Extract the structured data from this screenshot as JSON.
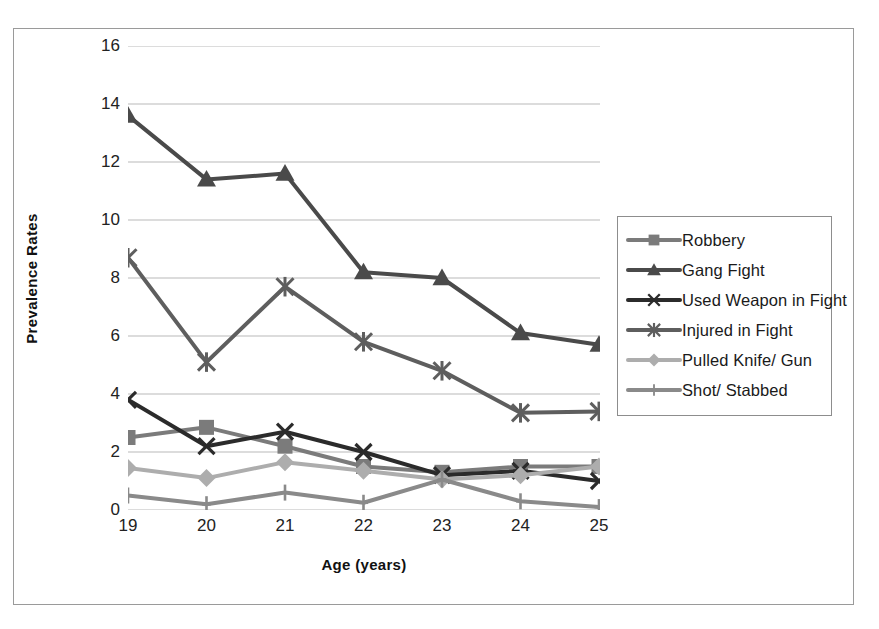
{
  "chart_data": {
    "type": "line",
    "title": "",
    "xlabel": "Age (years)",
    "ylabel": "Prevalence Rates",
    "categories": [
      "19",
      "20",
      "21",
      "22",
      "23",
      "24",
      "25"
    ],
    "x": [
      19,
      20,
      21,
      22,
      23,
      24,
      25
    ],
    "xlim": [
      19,
      25
    ],
    "ylim": [
      0,
      16
    ],
    "yticks": [
      0,
      2,
      4,
      6,
      8,
      10,
      12,
      14,
      16
    ],
    "grid": "horizontal",
    "legend_position": "right",
    "series": [
      {
        "name": "Robbery",
        "marker": "square",
        "color": "#7b7b7b",
        "values": [
          2.5,
          2.85,
          2.2,
          1.5,
          1.3,
          1.5,
          1.5
        ]
      },
      {
        "name": "Gang Fight",
        "marker": "triangle",
        "color": "#4a4a4a",
        "values": [
          13.6,
          11.4,
          11.6,
          8.2,
          8.0,
          6.1,
          5.7
        ]
      },
      {
        "name": "Used Weapon in Fight",
        "marker": "x",
        "color": "#2b2b2b",
        "values": [
          3.8,
          2.2,
          2.7,
          2.0,
          1.2,
          1.35,
          1.0
        ]
      },
      {
        "name": "Injured in Fight",
        "marker": "asterisk",
        "color": "#5e5e5e",
        "values": [
          8.7,
          5.1,
          7.7,
          5.8,
          4.8,
          3.35,
          3.4
        ]
      },
      {
        "name": "Pulled Knife/ Gun",
        "marker": "diamond",
        "color": "#adadad",
        "values": [
          1.45,
          1.1,
          1.65,
          1.35,
          1.05,
          1.2,
          1.5
        ]
      },
      {
        "name": "Shot/ Stabbed",
        "marker": "dash",
        "color": "#8a8a8a",
        "values": [
          0.5,
          0.2,
          0.6,
          0.25,
          1.05,
          0.3,
          0.1
        ]
      }
    ]
  },
  "legend": {
    "items": [
      "Robbery",
      "Gang Fight",
      "Used Weapon in Fight",
      "Injured in Fight",
      "Pulled Knife/ Gun",
      "Shot/ Stabbed"
    ]
  },
  "axes": {
    "y_title": "Prevalence Rates",
    "x_title": "Age (years)",
    "y_tick_labels": [
      "16",
      "14",
      "12",
      "10",
      "8",
      "6",
      "4",
      "2",
      "0"
    ],
    "x_tick_labels": [
      "19",
      "20",
      "21",
      "22",
      "23",
      "24",
      "25"
    ]
  }
}
